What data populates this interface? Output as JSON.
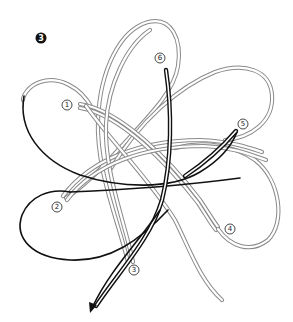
{
  "figure": {
    "type": "knot-tying-instruction-diagram",
    "step_badge": "3",
    "colors": {
      "rope_outline": "#8a8a8a",
      "working_end": "#111111",
      "background": "#ffffff"
    },
    "labels": [
      {
        "id": "1",
        "text": "1",
        "x": 67,
        "y": 105
      },
      {
        "id": "2",
        "text": "2",
        "x": 57,
        "y": 207
      },
      {
        "id": "3",
        "text": "3",
        "x": 133,
        "y": 270
      },
      {
        "id": "4",
        "text": "4",
        "x": 230,
        "y": 229
      },
      {
        "id": "5",
        "text": "5",
        "x": 243,
        "y": 124
      },
      {
        "id": "6",
        "text": "6",
        "x": 160,
        "y": 58
      }
    ],
    "arrow": {
      "direction": "down-left",
      "meaning": "pull working end"
    }
  }
}
